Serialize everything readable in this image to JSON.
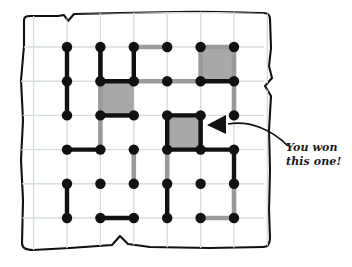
{
  "figure": {
    "kind": "dots-and-boxes-game-board",
    "title": "",
    "annotation": {
      "name": "callout-you-won-this-one",
      "line1": "You won",
      "line2": "this one!",
      "arrow": "curved-arrow-pointing-left",
      "target_box": "r3c5"
    },
    "colors": {
      "paper": "#ffffff",
      "paper_edge": "#111111",
      "grid_line": "#d6dde2",
      "dot": "#111111",
      "player_a_line": "#111111",
      "player_b_line": "#9a9a9a",
      "captured_box_fill": "#a8a8a8",
      "ink": "#1a1a1a"
    },
    "grid": {
      "rows": 6,
      "cols": 6,
      "origin_x": 67,
      "origin_y": 47,
      "step_x": 33.4,
      "step_y": 34.2,
      "dot_radius": 5.2
    },
    "paper_outline": "M 24,20 C 24,17 26,16 30,16 L 58,16 L 64,15 L 68,21 L 74,14 L 120,13 L 175,12 C 215,11 248,13 263,13 C 268,13 270,15 270,19 L 271,48 L 269,66 L 272,78 L 265,86 L 271,96 L 269,130 L 270,170 L 269,210 L 270,238 C 270,244 268,247 263,247 L 210,248 L 150,247 L 128,244 L 120,236 L 112,245 L 70,248 L 33,250 C 26,250 22,248 22,243 L 23,200 L 21,160 L 23,120 L 21,80 L 24,46 Z",
    "captured_boxes": [
      {
        "name": "box-r1c5",
        "row": 1,
        "col": 5,
        "owner": "player_b"
      },
      {
        "name": "box-r2c2",
        "row": 2,
        "col": 2,
        "owner": "player_a"
      },
      {
        "name": "box-r3c4",
        "row": 3,
        "col": 4,
        "owner": "player_a"
      }
    ],
    "black_segments": [
      {
        "name": "seg-h-r2c2",
        "type": "h",
        "row": 2,
        "col": 2
      },
      {
        "name": "seg-h-r1c5-bottom",
        "type": "h",
        "row": 2,
        "col": 5
      },
      {
        "name": "seg-v-r2c2-left",
        "type": "v",
        "row": 2,
        "col": 2
      },
      {
        "name": "seg-v-r2c3-right",
        "type": "v",
        "row": 2,
        "col": 3
      },
      {
        "name": "seg-h-r3c2",
        "type": "h",
        "row": 3,
        "col": 2
      },
      {
        "name": "seg-v-r1c1",
        "type": "v",
        "row": 2,
        "col": 1
      },
      {
        "name": "seg-v-r2c1",
        "type": "v",
        "row": 3,
        "col": 1
      },
      {
        "name": "seg-h-r4c1",
        "type": "h",
        "row": 4,
        "col": 1
      },
      {
        "name": "seg-h-r3c4-top",
        "type": "h",
        "row": 3,
        "col": 4
      },
      {
        "name": "seg-v-r3c4-left",
        "type": "v",
        "row": 4,
        "col": 4
      },
      {
        "name": "seg-v-r3c5-right",
        "type": "v",
        "row": 4,
        "col": 5
      },
      {
        "name": "seg-h-r4c4",
        "type": "h",
        "row": 4,
        "col": 4
      },
      {
        "name": "seg-h-r4c5",
        "type": "h",
        "row": 4,
        "col": 5
      },
      {
        "name": "seg-v-r4c6",
        "type": "v",
        "row": 5,
        "col": 6
      },
      {
        "name": "seg-v-r5c1",
        "type": "v",
        "row": 6,
        "col": 1
      },
      {
        "name": "seg-h-r6c2",
        "type": "h",
        "row": 6,
        "col": 2
      },
      {
        "name": "seg-v-r5c4",
        "type": "v",
        "row": 6,
        "col": 4
      }
    ],
    "gray_segments": [
      {
        "name": "gseg-h-r1c3",
        "type": "h",
        "row": 1,
        "col": 3
      },
      {
        "name": "gseg-h-r1c5",
        "type": "h",
        "row": 1,
        "col": 5
      },
      {
        "name": "gseg-v-r1c2-left",
        "type": "v",
        "row": 2,
        "col": 2
      },
      {
        "name": "gseg-v-r1c5",
        "type": "v",
        "row": 2,
        "col": 5
      },
      {
        "name": "gseg-v-r1c6",
        "type": "v",
        "row": 2,
        "col": 6
      },
      {
        "name": "gseg-h-r2c3",
        "type": "h",
        "row": 2,
        "col": 3
      },
      {
        "name": "gseg-h-r2c4",
        "type": "h",
        "row": 2,
        "col": 4
      },
      {
        "name": "gseg-v-r2c2",
        "type": "v",
        "row": 3,
        "col": 2
      },
      {
        "name": "gseg-v-r2c6",
        "type": "v",
        "row": 3,
        "col": 6
      },
      {
        "name": "gseg-h-r3c2-under",
        "type": "h",
        "row": 3,
        "col": 2
      },
      {
        "name": "gseg-v-r3c2",
        "type": "v",
        "row": 4,
        "col": 2
      },
      {
        "name": "gseg-v-r3c5",
        "type": "v",
        "row": 4,
        "col": 5
      },
      {
        "name": "gseg-v-r4c4",
        "type": "v",
        "row": 5,
        "col": 4
      },
      {
        "name": "gseg-v-r4c3",
        "type": "v",
        "row": 5,
        "col": 3
      },
      {
        "name": "gseg-v-r5c6",
        "type": "v",
        "row": 6,
        "col": 6
      },
      {
        "name": "gseg-h-r6c5",
        "type": "h",
        "row": 6,
        "col": 5
      }
    ],
    "arrow": {
      "name": "callout-arrow",
      "tail": "M 288,146 C 272,130 250,120 228,124",
      "head": "M 226,115 L 226,134 L 207,125 Z"
    }
  }
}
